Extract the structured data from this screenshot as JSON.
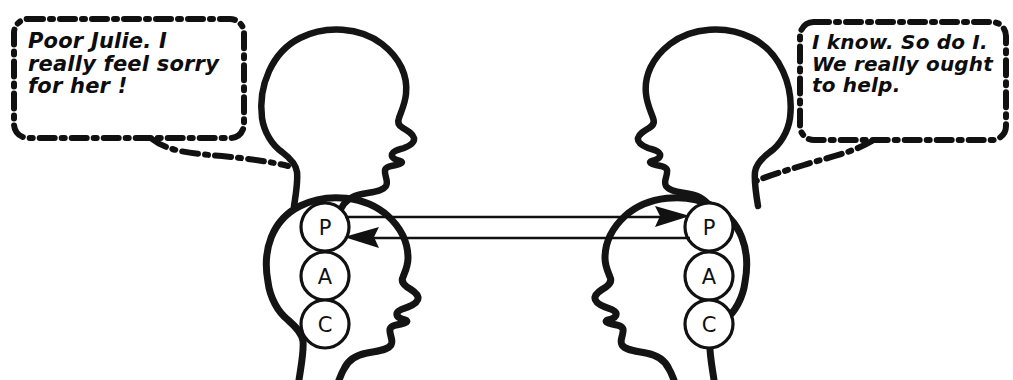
{
  "scene": {
    "title": "Transactional Analysis complementary transaction diagram",
    "width": 1013,
    "height": 380,
    "background_color": "#ffffff",
    "ink_color": "#111111"
  },
  "bubbles": {
    "left": {
      "text": "Poor Julie. I\nreally feel sorry\nfor her !",
      "border_style": "dash-dot",
      "tail_direction": "down-right"
    },
    "right": {
      "text": "I know. So do I.\nWe really ought\nto help.",
      "border_style": "dash-dot",
      "tail_direction": "down-left"
    }
  },
  "heads": {
    "upper_left": {
      "label": "profile-head-facing-right",
      "facing": "right"
    },
    "upper_right": {
      "label": "profile-head-facing-left",
      "facing": "left"
    },
    "lower_left": {
      "label": "ego-state-head-facing-right",
      "facing": "right"
    },
    "lower_right": {
      "label": "ego-state-head-facing-left",
      "facing": "left"
    }
  },
  "ego_states": {
    "left": [
      {
        "letter": "P",
        "name": "parent"
      },
      {
        "letter": "A",
        "name": "adult"
      },
      {
        "letter": "C",
        "name": "child"
      }
    ],
    "right": [
      {
        "letter": "P",
        "name": "parent"
      },
      {
        "letter": "A",
        "name": "adult"
      },
      {
        "letter": "C",
        "name": "child"
      }
    ]
  },
  "transactions": [
    {
      "id": "stimulus",
      "from": "left-parent",
      "to": "right-parent",
      "direction": "right"
    },
    {
      "id": "response",
      "from": "right-parent",
      "to": "left-parent",
      "direction": "left"
    }
  ]
}
